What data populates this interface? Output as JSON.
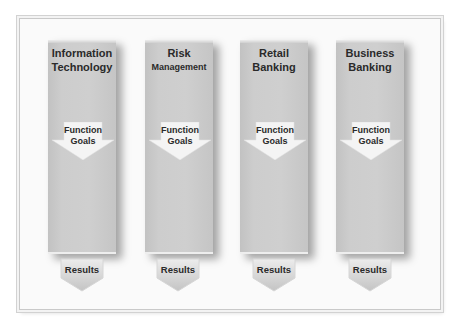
{
  "diagram": {
    "columns": [
      {
        "title_line1": "Information",
        "title_line2": "Technology",
        "goal_line1": "Function",
        "goal_line2": "Goals",
        "result": "Results"
      },
      {
        "title_line1": "Risk",
        "title_line2": "Management",
        "goal_line1": "Function",
        "goal_line2": "Goals",
        "result": "Results"
      },
      {
        "title_line1": "Retail",
        "title_line2": "Banking",
        "goal_line1": "Function",
        "goal_line2": "Goals",
        "result": "Results"
      },
      {
        "title_line1": "Business",
        "title_line2": "Banking",
        "goal_line1": "Function",
        "goal_line2": "Goals",
        "result": "Results"
      }
    ],
    "colors": {
      "column": "#cccccc",
      "arrow": "#f4f4f4",
      "result_arrow_top": "#ececec",
      "result_arrow_bottom": "#c4c4c4",
      "text": "#2a2a2a"
    }
  }
}
